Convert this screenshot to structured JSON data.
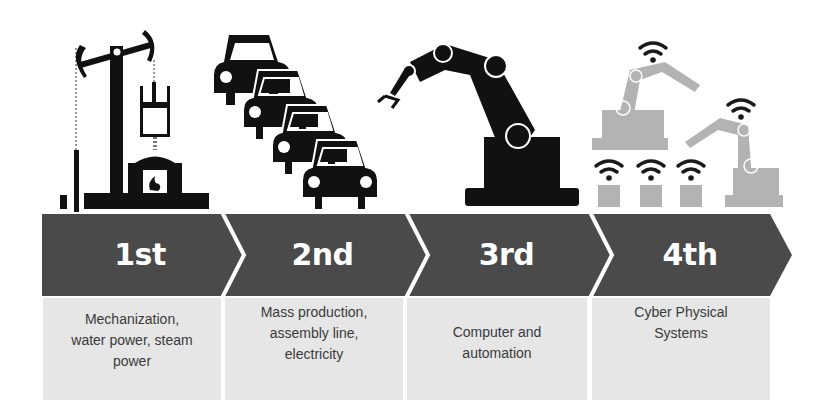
{
  "diagram": {
    "colors": {
      "band": "#4a4a4a",
      "separator": "#ffffff",
      "label_text": "#ffffff",
      "desc_bg": "#e6e6e6",
      "desc_text": "#3a3a3a",
      "icon_dark": "#111111",
      "icon_light": "#b3b3b3"
    },
    "stages": [
      {
        "label": "1st",
        "icon": "steam-engine-icon",
        "description_lines": [
          "Mechanization,",
          "water power, steam",
          "power"
        ]
      },
      {
        "label": "2nd",
        "icon": "assembly-line-cars-icon",
        "description_lines": [
          "Mass production,",
          "assembly line,",
          "electricity"
        ]
      },
      {
        "label": "3rd",
        "icon": "industrial-robot-arm-icon",
        "description_lines": [
          "Computer and",
          "automation"
        ]
      },
      {
        "label": "4th",
        "icon": "connected-robots-wifi-icon",
        "description_lines": [
          "Cyber Physical",
          "Systems"
        ]
      }
    ]
  }
}
